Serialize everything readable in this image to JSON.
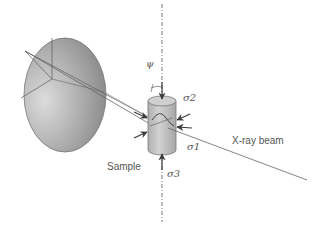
{
  "diagram": {
    "title": "",
    "labels": {
      "psi": "ψ",
      "sigma1": "σ1",
      "sigma2": "σ2",
      "sigma3": "σ3",
      "sample": "Sample",
      "beam": "X-ray beam"
    },
    "colors": {
      "background": "#ffffff",
      "line": "#666666",
      "detector_light": "#d8d8d8",
      "detector_dark": "#8a8a8a",
      "sample_fill": "#c4c4c4",
      "arrow": "#3a3a3a",
      "text": "#555555"
    },
    "elements": [
      {
        "id": "detector",
        "shape": "ellipse",
        "description": "Area detector (grey disc) with radial lines"
      },
      {
        "id": "sample",
        "shape": "cylinder",
        "description": "Cylindrical sample under stress"
      },
      {
        "id": "axis",
        "shape": "dash-dot line",
        "description": "Vertical rotation axis"
      },
      {
        "id": "beam",
        "shape": "line",
        "description": "Incident X-ray beam"
      },
      {
        "id": "diffracted-rays",
        "shape": "lines",
        "description": "Diffracted rays from sample to detector"
      },
      {
        "id": "stress-arrows",
        "shape": "arrows",
        "description": "Compressive stress arrows σ1, σ2, σ3"
      }
    ]
  }
}
